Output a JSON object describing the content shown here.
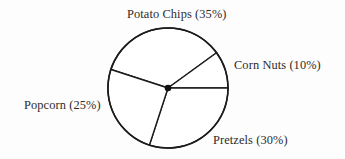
{
  "chart_data": {
    "type": "pie",
    "title": "",
    "subtitle": "",
    "xlabel": "",
    "ylabel": "",
    "grid": false,
    "legend_position": "outside-labels",
    "units": "percent",
    "total": 100,
    "categories": [
      "Potato Chips",
      "Corn Nuts",
      "Pretzels",
      "Popcorn"
    ],
    "values": [
      35,
      10,
      30,
      25
    ],
    "slices": [
      {
        "name": "Potato Chips",
        "value": 35,
        "label": "Potato Chips (35%)",
        "start_angle_deg": 198,
        "end_angle_deg": 324,
        "sweep_deg": 126,
        "label_position": "top"
      },
      {
        "name": "Corn Nuts",
        "value": 10,
        "label": "Corn Nuts (10%)",
        "start_angle_deg": 324,
        "end_angle_deg": 360,
        "sweep_deg": 36,
        "label_position": "right"
      },
      {
        "name": "Pretzels",
        "value": 30,
        "label": "Pretzels (30%)",
        "start_angle_deg": 0,
        "end_angle_deg": 108,
        "sweep_deg": 108,
        "label_position": "bottom-right"
      },
      {
        "name": "Popcorn",
        "value": 25,
        "label": "Popcorn (25%)",
        "start_angle_deg": 108,
        "end_angle_deg": 198,
        "sweep_deg": 90,
        "label_position": "left"
      }
    ],
    "geometry": {
      "center_x": 168,
      "center_y": 88,
      "radius": 60
    },
    "colors": {
      "background": "#fdfdfd",
      "slice_fill": "#ffffff",
      "stroke": "#1b1b1b",
      "text": "#2c2c2c",
      "center_dot": "#111111"
    }
  },
  "labels": {
    "potato_chips": "Potato Chips (35%)",
    "corn_nuts": "Corn Nuts (10%)",
    "pretzels": "Pretzels (30%)",
    "popcorn": "Popcorn (25%)"
  }
}
